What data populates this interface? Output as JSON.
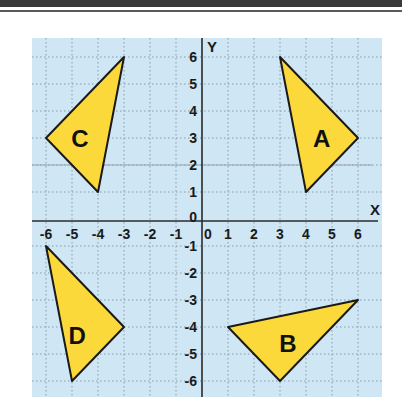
{
  "diagram": {
    "type": "coordinate-grid",
    "axes": {
      "x_label": "X",
      "y_label": "Y",
      "x_range": [
        -6,
        6
      ],
      "y_range": [
        -6,
        6
      ],
      "x_ticks": [
        "-6",
        "-5",
        "-4",
        "-3",
        "-2",
        "-1",
        "0",
        "1",
        "2",
        "3",
        "4",
        "5",
        "6"
      ],
      "y_ticks": [
        "6",
        "5",
        "4",
        "3",
        "2",
        "1",
        "0",
        "-1",
        "-2",
        "-3",
        "-4",
        "-5",
        "-6"
      ]
    },
    "colors": {
      "grid_background": "#cfe6f5",
      "grid_lines": "#8a9aa8",
      "axis": "#2a2a2a",
      "shape_fill": "#fcd93a",
      "shape_stroke": "#1a1a1a"
    },
    "triangles": [
      {
        "label": "A",
        "vertices": [
          [
            3,
            6
          ],
          [
            6,
            3
          ],
          [
            4,
            1
          ]
        ],
        "label_pos": [
          4.6,
          3
        ]
      },
      {
        "label": "B",
        "vertices": [
          [
            1,
            -4
          ],
          [
            6,
            -3
          ],
          [
            3,
            -6
          ]
        ],
        "label_pos": [
          3.3,
          -4.6
        ]
      },
      {
        "label": "C",
        "vertices": [
          [
            -3,
            6
          ],
          [
            -6,
            3
          ],
          [
            -4,
            1
          ]
        ],
        "label_pos": [
          -4.7,
          3
        ]
      },
      {
        "label": "D",
        "vertices": [
          [
            -6,
            -1
          ],
          [
            -3,
            -4
          ],
          [
            -5,
            -6
          ]
        ],
        "label_pos": [
          -4.8,
          -4.3
        ]
      }
    ]
  }
}
